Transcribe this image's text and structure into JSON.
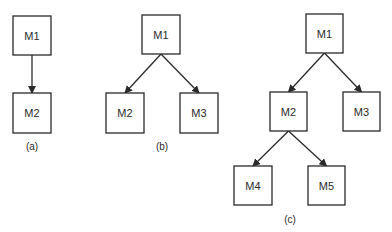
{
  "diagrams": [
    {
      "id": "a",
      "caption": "(a)",
      "caption_pos": [
        32,
        146
      ],
      "nodes": [
        {
          "id": "M1",
          "label": "M1",
          "x": 13,
          "y": 16,
          "w": 38,
          "h": 39
        },
        {
          "id": "M2",
          "label": "M2",
          "x": 13,
          "y": 93,
          "w": 38,
          "h": 40
        }
      ],
      "edges": [
        {
          "from": "M1",
          "to": "M2"
        }
      ]
    },
    {
      "id": "b",
      "caption": "(b)",
      "caption_pos": [
        162,
        146
      ],
      "nodes": [
        {
          "id": "M1",
          "label": "M1",
          "x": 142,
          "y": 15,
          "w": 38,
          "h": 39
        },
        {
          "id": "M2",
          "label": "M2",
          "x": 106,
          "y": 93,
          "w": 38,
          "h": 40
        },
        {
          "id": "M3",
          "label": "M3",
          "x": 180,
          "y": 93,
          "w": 38,
          "h": 40
        }
      ],
      "edges": [
        {
          "from": "M1",
          "to": "M2"
        },
        {
          "from": "M1",
          "to": "M3"
        }
      ]
    },
    {
      "id": "c",
      "caption": "(c)",
      "caption_pos": [
        290,
        219
      ],
      "nodes": [
        {
          "id": "M1",
          "label": "M1",
          "x": 306,
          "y": 14,
          "w": 37,
          "h": 39
        },
        {
          "id": "M2",
          "label": "M2",
          "x": 270,
          "y": 92,
          "w": 37,
          "h": 39
        },
        {
          "id": "M3",
          "label": "M3",
          "x": 343,
          "y": 92,
          "w": 37,
          "h": 39
        },
        {
          "id": "M4",
          "label": "M4",
          "x": 234,
          "y": 166,
          "w": 38,
          "h": 39
        },
        {
          "id": "M5",
          "label": "M5",
          "x": 308,
          "y": 166,
          "w": 37,
          "h": 39
        }
      ],
      "edges": [
        {
          "from": "M1",
          "to": "M2"
        },
        {
          "from": "M1",
          "to": "M3"
        },
        {
          "from": "M2",
          "to": "M4"
        },
        {
          "from": "M2",
          "to": "M5"
        }
      ]
    }
  ],
  "colors": {
    "stroke": "#2a2a2a",
    "background": "#ffffff"
  }
}
